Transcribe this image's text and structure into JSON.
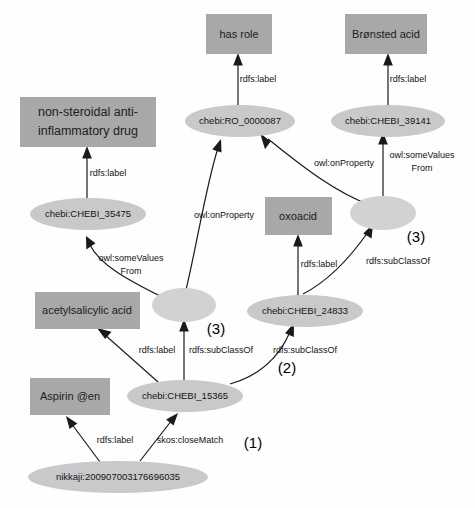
{
  "diagram": {
    "colors": {
      "rect_fill": "#a8a8a8",
      "ellipse_fill": "#c9c9c9",
      "blank_node_fill": "#d2d2d2",
      "edge_stroke": "#1a1a1a",
      "background": "#fefefe"
    }
  },
  "nodes": {
    "rect_has_role": "has role",
    "rect_bronsted_acid": "Brønsted acid",
    "rect_nsaid_line1": "non-steroidal anti-",
    "rect_nsaid_line2": "inflammatory drug",
    "rect_oxoacid": "oxoacid",
    "rect_acetylsalicylic_acid": "acetylsalicylic acid",
    "rect_aspirin_en": "Aspirin @en",
    "ellipse_ro_0000087": "chebi:RO_0000087",
    "ellipse_chebi_39141": "chebi:CHEBI_39141",
    "ellipse_chebi_35475": "chebi:CHEBI_35475",
    "ellipse_chebi_24833": "chebi:CHEBI_24833",
    "ellipse_chebi_15365": "chebi:CHEBI_15365",
    "ellipse_nikkaji": "nikkaji:200907003176696035",
    "blank_node_left": "",
    "blank_node_right": ""
  },
  "edges": {
    "label_rdfs_label_1": "rdfs:label",
    "label_rdfs_label_2": "rdfs:label",
    "label_rdfs_label_3": "rdfs:label",
    "label_rdfs_label_4": "rdfs:label",
    "label_rdfs_label_5": "rdfs:label",
    "label_rdfs_label_6": "rdfs:label",
    "label_owl_onproperty_left": "owl:onProperty",
    "label_owl_onproperty_right": "owl:onProperty",
    "label_owl_somevaluesfrom_left_line1": "owl:someValues",
    "label_owl_somevaluesfrom_left_line2": "From",
    "label_owl_somevaluesfrom_right_line1": "owl:someValues",
    "label_owl_somevaluesfrom_right_line2": "From",
    "label_rdfs_subclassof_1": "rdfs:subClassOf",
    "label_rdfs_subclassof_2": "rdfs:subClassOf",
    "label_rdfs_subclassof_3": "rdfs:subClassOf",
    "label_skos_closematch": "skos:closeMatch"
  },
  "annotations": {
    "annot_1": "(1)",
    "annot_2": "(2)",
    "annot_3_left": "(3)",
    "annot_3_right": "(3)"
  }
}
